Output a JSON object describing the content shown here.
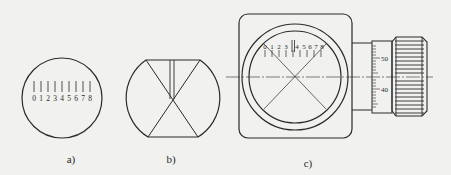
{
  "figure": {
    "panels": [
      {
        "id": "a",
        "caption": "a)",
        "description": "Circular reticle with linear scale",
        "scale_labels": [
          "0",
          "1",
          "2",
          "3",
          "4",
          "5",
          "6",
          "7",
          "8"
        ]
      },
      {
        "id": "b",
        "caption": "b)",
        "description": "Truncated circular reticle with crosshair X and double vertical index line"
      },
      {
        "id": "c",
        "caption": "c)",
        "description": "Eyepiece micrometer assembly with reticle scale, crosshair and drum micrometer",
        "scale_labels": [
          "0",
          "1",
          "2",
          "3",
          "4",
          "5",
          "6",
          "7",
          "8"
        ],
        "drum_labels": [
          "50",
          "40"
        ]
      }
    ],
    "colors": {
      "background": "#f1f1ef",
      "ink": "#2a2a2a"
    }
  }
}
